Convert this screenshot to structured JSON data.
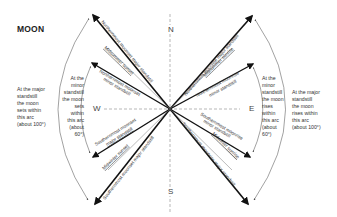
{
  "diagram": {
    "title": "MOON",
    "cardinals": {
      "north": "N",
      "south": "S",
      "east": "E",
      "west": "W"
    },
    "rays": [
      {
        "id": "ne-major",
        "label": "Northernmost moonset major standstill",
        "label_underlined": false
      },
      {
        "id": "nw-midsummer",
        "label": "Midsummer sunset",
        "label_underlined": true
      },
      {
        "id": "nw-minor",
        "label": "Northernmost moonset minor standstill",
        "label_underlined": false
      },
      {
        "id": "ne-major-rise",
        "label": "Northernmost moonrise major standstill",
        "label_underlined": false
      },
      {
        "id": "ne-midsummer",
        "label": "Midsummer sunrise",
        "label_underlined": true
      },
      {
        "id": "ne-minor-rise",
        "label": "Northernmost moonrise minor standstill",
        "label_underlined": false
      },
      {
        "id": "sw-minor",
        "label": "Southernmost moonset major standstill",
        "label_underlined": false
      },
      {
        "id": "sw-midwinter",
        "label": "Midwinter sunset",
        "label_underlined": true
      },
      {
        "id": "sw-major",
        "label": "Southernmost moonset major standstill",
        "label_underlined": false
      },
      {
        "id": "se-minor",
        "label": "Southernmost moonrise minor standstill",
        "label_underlined": false
      },
      {
        "id": "se-midwinter",
        "label": "Midwinter sunrise",
        "label_underlined": true
      },
      {
        "id": "se-major",
        "label": "Southernmost moonrise major standstill",
        "label_underlined": false
      }
    ],
    "labels_split": {
      "nw_major": [
        "Northernmost moonset major standstill"
      ],
      "nw_midsummer": [
        "Midsummer sunset"
      ],
      "nw_minor_1": "Northernmost moonset",
      "nw_minor_2": "minor standstill",
      "ne_major": "Northernmost moonrise major standstill",
      "ne_midsummer": "Midsummer sunrise",
      "ne_minor_1": "Northernmost moonrise",
      "ne_minor_2": "minor standstill",
      "sw_minor_1": "Southernmost moonset",
      "sw_minor_2": "major standstill",
      "sw_midwinter": "Midwinter sunset",
      "sw_major": "Southernmost moonset major standstill",
      "se_minor_1": "Southernmost moonrise",
      "se_minor_2": "minor standstill",
      "se_midwinter": "Midwinter sunrise",
      "se_major": "Southernmost moonrise major standstill"
    },
    "notes": {
      "left_major": [
        "At the major",
        "standstill",
        "the moon",
        "sets within",
        "this arc",
        "(about 100°)"
      ],
      "left_minor": [
        "At the",
        "minor",
        "standstill",
        "the moon",
        "sets",
        "within",
        "this arc",
        "(about",
        "60°)"
      ],
      "right_minor": [
        "At the",
        "minor",
        "standstill",
        "the moon",
        "rises",
        "within",
        "this arc",
        "(about",
        "60°)"
      ],
      "right_major": [
        "At the major",
        "standstill",
        "the moon",
        "rises within",
        "this arc",
        "(about 100°)"
      ]
    }
  }
}
